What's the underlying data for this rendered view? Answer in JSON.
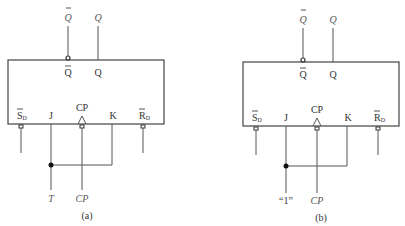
{
  "diagrams": [
    {
      "id": "a",
      "caption": "(a)",
      "outputs": {
        "qbar_ext": "Q",
        "q_ext": "Q"
      },
      "pins_top": {
        "qbar": "Q",
        "q": "Q"
      },
      "pins_bottom": {
        "sd": "S",
        "sd_sub": "D",
        "j": "J",
        "cp": "CP",
        "k": "K",
        "rd": "R",
        "rd_sub": "D"
      },
      "inputs": {
        "jk_tied": "T",
        "clock": "CP"
      }
    },
    {
      "id": "b",
      "caption": "(b)",
      "outputs": {
        "qbar_ext": "Q",
        "q_ext": "Q"
      },
      "pins_top": {
        "qbar": "Q",
        "q": "Q"
      },
      "pins_bottom": {
        "sd": "S",
        "sd_sub": "D",
        "j": "J",
        "cp": "CP",
        "k": "K",
        "rd": "R",
        "rd_sub": "D"
      },
      "inputs": {
        "jk_tied": "“1”",
        "clock": "CP"
      }
    }
  ],
  "colors": {
    "line": "#555555",
    "text": "#333333"
  }
}
